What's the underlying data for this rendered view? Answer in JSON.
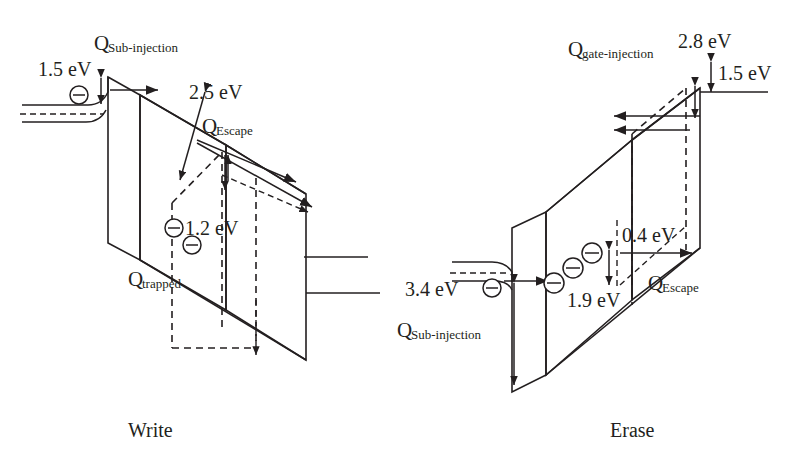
{
  "figure": {
    "title": "",
    "type": "band-diagram",
    "panels": [
      {
        "id": "write",
        "caption": "Write",
        "labels": {
          "q_sub_injection_q": "Q",
          "q_sub_injection_sub": "Sub-injection",
          "barrier_left": "1.5 eV",
          "barrier_mid": "2.5 eV",
          "q_escape_q": "Q",
          "q_escape_sub": "Escape",
          "trap_depth": "1.2 eV",
          "q_trapped_q": "Q",
          "q_trapped_sub": "trapped"
        },
        "electrons": 3
      },
      {
        "id": "erase",
        "caption": "Erase",
        "labels": {
          "q_gate_injection_q": "Q",
          "q_gate_injection_sub": "gate-injection",
          "barrier_top": "2.8 eV",
          "barrier_offset": "1.5 eV",
          "barrier_small": "0.4 eV",
          "q_escape_q": "Q",
          "q_escape_sub": "Escape",
          "trap_depth": "1.9 eV",
          "barrier_sub": "3.4 eV",
          "q_sub_injection_q": "Q",
          "q_sub_injection_sub": "Sub-injection"
        },
        "electrons": 4
      }
    ],
    "energy_values_ev": {
      "write_substrate_barrier": 1.5,
      "write_nitride_barrier": 2.5,
      "write_trap_depth": 1.2,
      "erase_gate_barrier": 2.8,
      "erase_band_offset": 1.5,
      "erase_escape_barrier": 0.4,
      "erase_trap_depth": 1.9,
      "erase_substrate_barrier": 3.4
    },
    "colors": {
      "ink": "#231f20",
      "fill_light": "#e7eaee",
      "fill_mid": "#ccd2da",
      "background": "#ffffff"
    }
  }
}
